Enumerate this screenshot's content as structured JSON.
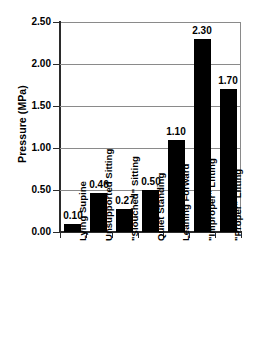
{
  "chart_data": {
    "type": "bar",
    "title": "",
    "xlabel": "",
    "ylabel": "Pressure (MPa)",
    "ylim": [
      0.0,
      2.5
    ],
    "yticks": [
      "0.00",
      "0.50",
      "1.00",
      "1.50",
      "2.00",
      "2.50"
    ],
    "ytick_values": [
      0.0,
      0.5,
      1.0,
      1.5,
      2.0,
      2.5
    ],
    "grid": true,
    "legend": "none",
    "bar_color": "#000000",
    "categories": [
      "Lying Supine",
      "Unsupported Sitting",
      "\"Slouched\" Sitting",
      "Quiet Standing",
      "Leaning Forward",
      "\"Improper\" Lifting",
      "\"Proper\" Lifting"
    ],
    "values": [
      0.1,
      0.46,
      0.27,
      0.5,
      1.1,
      2.3,
      1.7
    ],
    "data_labels": [
      "0.10",
      "0.46",
      "0.27",
      "0.50",
      "1.10",
      "2.30",
      "1.70"
    ]
  },
  "colors": {
    "background": "#ffffff",
    "bar": "#000000",
    "axis": "#2b2b2b",
    "gridline": "#8a8a8a",
    "text": "#000000"
  }
}
